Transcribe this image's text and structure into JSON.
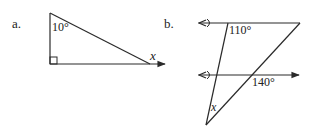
{
  "figures": [
    {
      "label": "a.",
      "shape": "right triangle",
      "angles": {
        "top": "10°",
        "bottom_left": "right angle",
        "bottom_right": "x"
      }
    },
    {
      "label": "b.",
      "shape": "triangle between two parallel lines",
      "angles": {
        "top_left": "110°",
        "middle_right": "140°",
        "bottom": "x"
      }
    }
  ],
  "colors": {
    "ink": "#2a2a2a",
    "background": "#ffffff"
  }
}
